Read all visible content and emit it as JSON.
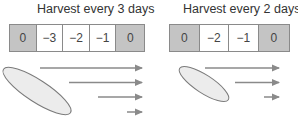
{
  "panels": [
    {
      "title": "Harvest every 3 days",
      "cells": [
        {
          "label": "0",
          "type": "harvest"
        },
        {
          "label": "−3",
          "type": "growth"
        },
        {
          "label": "−2",
          "type": "growth"
        },
        {
          "label": "−1",
          "type": "growth"
        },
        {
          "label": "0",
          "type": "harvest"
        }
      ],
      "arrows": 4
    },
    {
      "title": "Harvest every 2 days",
      "cells": [
        {
          "label": "0",
          "type": "harvest"
        },
        {
          "label": "−2",
          "type": "growth"
        },
        {
          "label": "−1",
          "type": "growth"
        },
        {
          "label": "0",
          "type": "harvest"
        }
      ],
      "arrows": 3
    }
  ],
  "colors": {
    "harvest_cell": "#c4c4c4",
    "growth_cell": "#ffffff",
    "border": "#8a8a8a",
    "arrow": "#8a8a8a",
    "ellipse_fill": "#ececec",
    "ellipse_stroke": "#7a7a7a"
  }
}
